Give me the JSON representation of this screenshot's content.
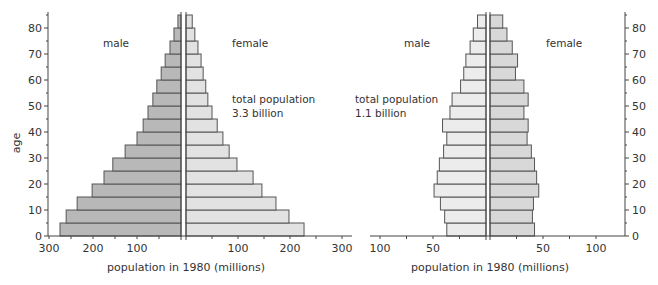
{
  "chart_data": [
    {
      "type": "bar",
      "subtype": "population-pyramid",
      "title": "",
      "xlabel": "population in 1980 (millions)",
      "ylabel": "age",
      "annotation": [
        "total population",
        "3.3 billion"
      ],
      "left_label": "male",
      "right_label": "female",
      "age_groups": [
        0,
        5,
        10,
        15,
        20,
        25,
        30,
        35,
        40,
        45,
        50,
        55,
        60,
        65,
        70,
        75,
        80
      ],
      "y_ticks": [
        0,
        10,
        20,
        30,
        40,
        50,
        60,
        70,
        80
      ],
      "x_ticks_male": [
        300,
        200,
        100
      ],
      "x_ticks_female": [
        100,
        200,
        300
      ],
      "xlim": [
        0,
        300
      ],
      "series": [
        {
          "name": "male",
          "color": "#b8b8b8",
          "values": [
            275,
            261,
            236,
            202,
            175,
            155,
            127,
            100,
            86,
            75,
            64,
            55,
            45,
            36,
            25,
            16,
            7
          ]
        },
        {
          "name": "female",
          "color": "#e2e2e2",
          "values": [
            227,
            198,
            173,
            146,
            129,
            98,
            83,
            71,
            60,
            50,
            42,
            38,
            33,
            29,
            23,
            17,
            12
          ]
        }
      ],
      "grid": false
    },
    {
      "type": "bar",
      "subtype": "population-pyramid",
      "title": "",
      "xlabel": "population in 1980 (millions)",
      "ylabel": "",
      "annotation": [
        "total population",
        "1.1 billion"
      ],
      "left_label": "male",
      "right_label": "female",
      "age_groups": [
        0,
        5,
        10,
        15,
        20,
        25,
        30,
        35,
        40,
        45,
        50,
        55,
        60,
        65,
        70,
        75,
        80
      ],
      "y_ticks": [
        0,
        10,
        20,
        30,
        40,
        50,
        60,
        70,
        80
      ],
      "x_ticks_male": [
        100,
        50
      ],
      "x_ticks_female": [
        50,
        100
      ],
      "xlim": [
        0,
        120
      ],
      "series": [
        {
          "name": "male",
          "color": "#ececec",
          "values": [
            37,
            39,
            43,
            49,
            46,
            44,
            40,
            37,
            41,
            34,
            32,
            24,
            21,
            19,
            15,
            12,
            8
          ]
        },
        {
          "name": "female",
          "color": "#d8d8d8",
          "values": [
            42,
            40,
            41,
            46,
            44,
            42,
            39,
            35,
            36,
            32,
            36,
            32,
            24,
            26,
            21,
            16,
            12
          ]
        }
      ],
      "grid": false
    }
  ],
  "labels": {
    "left_male": "male",
    "left_female": "female",
    "left_total_1": "total population",
    "left_total_2": "3.3 billion",
    "right_male": "male",
    "right_female": "female",
    "right_total_1": "total population",
    "right_total_2": "1.1 billion",
    "left_xlabel": "population in 1980 (millions)",
    "right_xlabel": "population in 1980 (millions)",
    "ylabel": "age"
  }
}
